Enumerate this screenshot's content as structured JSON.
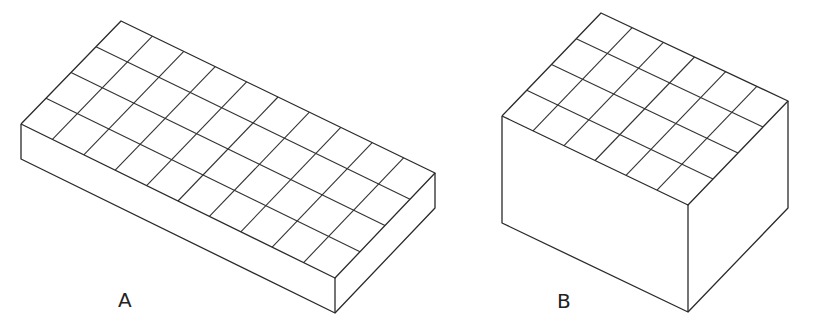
{
  "figure": {
    "line_color": "#2a2a2a",
    "background": "#ffffff"
  },
  "boxes": [
    {
      "label": "A",
      "top_grid": {
        "long_cells": 10,
        "short_cells": 4
      },
      "corners": {
        "back": [
          121,
          21
        ],
        "left": [
          21,
          124
        ],
        "front": [
          335,
          278
        ],
        "right": [
          435,
          173
        ]
      },
      "height": 35,
      "label_pos": [
        118,
        290
      ]
    },
    {
      "label": "B",
      "top_grid": {
        "long_cells": 6,
        "short_cells": 4
      },
      "corners": {
        "back": [
          601,
          13
        ],
        "left": [
          502,
          116
        ],
        "front": [
          688,
          205
        ],
        "right": [
          788,
          101
        ]
      },
      "height": 107,
      "label_pos": [
        557,
        291
      ]
    }
  ]
}
